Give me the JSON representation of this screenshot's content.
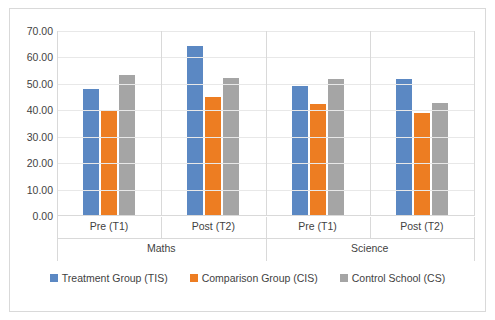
{
  "chart_data": {
    "type": "bar",
    "title": "",
    "xlabel": "",
    "ylabel": "",
    "ylim": [
      0,
      70
    ],
    "ytick_step": 10,
    "grid": true,
    "legend_position": "bottom",
    "group_labels": [
      "Maths",
      "Science"
    ],
    "categories": [
      "Pre (T1)",
      "Post (T2)",
      "Pre (T1)",
      "Post (T2)"
    ],
    "series": [
      {
        "name": "Treatment Group (TIS)",
        "color": "#5b88c3",
        "values": [
          47.5,
          64.0,
          49.0,
          51.5
        ]
      },
      {
        "name": "Comparison Group (CIS)",
        "color": "#ed7d22",
        "values": [
          39.8,
          44.5,
          42.0,
          38.6
        ]
      },
      {
        "name": "Control School (CS)",
        "color": "#a5a5a5",
        "values": [
          53.0,
          51.8,
          51.5,
          42.2
        ]
      }
    ],
    "ytick_labels": [
      "70.00",
      "60.00",
      "50.00",
      "40.00",
      "30.00",
      "20.00",
      "10.00",
      "0.00"
    ],
    "ytick_values": [
      70,
      60,
      50,
      40,
      30,
      20,
      10,
      0
    ]
  }
}
